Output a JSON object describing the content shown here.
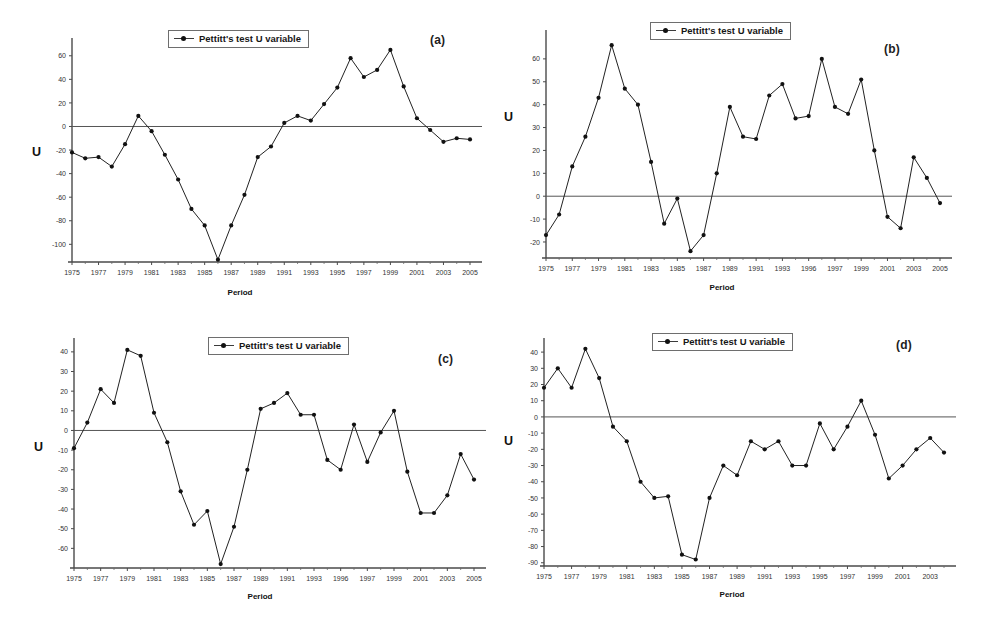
{
  "figure": {
    "legend_label": "Pettitt's test U variable",
    "x_axis_title": "Period",
    "y_axis_title": "U",
    "zero_line_color": "#555555",
    "series_color": "#222222",
    "marker_color": "#111111"
  },
  "chart_data": [
    {
      "type": "line",
      "panel": "(a)",
      "title": "",
      "xlabel": "Period",
      "ylabel": "U",
      "legend": [
        "Pettitt's test U variable"
      ],
      "legend_position": "top-center",
      "grid": false,
      "xlim": [
        1975,
        2005
      ],
      "ylim": [
        -115,
        70
      ],
      "yticks": [
        60,
        40,
        20,
        0,
        -20,
        -40,
        -60,
        -80,
        -100
      ],
      "ytick_labels": [
        "60",
        "40",
        "20",
        "0",
        "-20",
        "-40",
        "-60",
        "-80",
        "-100"
      ],
      "xticks": [
        1975,
        1977,
        1979,
        1981,
        1983,
        1985,
        1987,
        1989,
        1991,
        1993,
        1995,
        1997,
        1999,
        2001,
        2003,
        2005
      ],
      "xtick_labels": [
        "1975",
        "1977",
        "1979",
        "1981",
        "1983",
        "1985",
        "1987",
        "1989",
        "1991",
        "1993",
        "1995",
        "1997",
        "1999",
        "2001",
        "2003",
        "2005"
      ],
      "x": [
        1975,
        1976,
        1977,
        1978,
        1979,
        1980,
        1981,
        1982,
        1983,
        1984,
        1985,
        1986,
        1987,
        1988,
        1989,
        1990,
        1991,
        1992,
        1993,
        1994,
        1995,
        1996,
        1997,
        1998,
        1999,
        2000,
        2001,
        2002,
        2003,
        2004,
        2005
      ],
      "values": [
        -22,
        -27,
        -26,
        -34,
        -15,
        9,
        -4,
        -24,
        -45,
        -70,
        -84,
        -113,
        -84,
        -58,
        -26,
        -17,
        3,
        9,
        5,
        19,
        33,
        58,
        42,
        48,
        65,
        34,
        7,
        -3,
        -13,
        -10,
        -11
      ]
    },
    {
      "type": "line",
      "panel": "(b)",
      "title": "",
      "xlabel": "Period",
      "ylabel": "U",
      "legend": [
        "Pettitt's test U variable"
      ],
      "legend_position": "top-center",
      "grid": false,
      "xlim": [
        1975,
        2005
      ],
      "ylim": [
        -27,
        70
      ],
      "yticks": [
        60,
        50,
        40,
        30,
        20,
        10,
        0,
        -10,
        -20
      ],
      "ytick_labels": [
        "60",
        "50",
        "40",
        "30",
        "20",
        "10",
        "0",
        "-10",
        "-20"
      ],
      "xticks": [
        1975,
        1977,
        1979,
        1981,
        1983,
        1985,
        1987,
        1989,
        1991,
        1993,
        1995,
        1997,
        1999,
        2001,
        2003,
        2005
      ],
      "xtick_labels": [
        "1975",
        "1977",
        "1979",
        "1981",
        "1983",
        "1985",
        "1987",
        "1989",
        "1991",
        "1993",
        "1996",
        "1997",
        "1999",
        "2001",
        "2003",
        "2005"
      ],
      "x": [
        1975,
        1976,
        1977,
        1978,
        1979,
        1980,
        1981,
        1982,
        1983,
        1984,
        1985,
        1986,
        1987,
        1988,
        1989,
        1990,
        1991,
        1992,
        1993,
        1994,
        1995,
        1996,
        1997,
        1998,
        1999,
        2000,
        2001,
        2002,
        2003,
        2004,
        2005
      ],
      "values": [
        -17,
        -8,
        13,
        26,
        43,
        66,
        47,
        40,
        15,
        -12,
        -1,
        -24,
        -17,
        10,
        39,
        26,
        25,
        44,
        49,
        34,
        35,
        60,
        39,
        36,
        51,
        20,
        -9,
        -14,
        17,
        8,
        -3
      ]
    },
    {
      "type": "line",
      "panel": "(c)",
      "title": "",
      "xlabel": "Period",
      "ylabel": "U",
      "legend": [
        "Pettitt's test U variable"
      ],
      "legend_position": "top-center",
      "grid": false,
      "xlim": [
        1975,
        2005
      ],
      "ylim": [
        -70,
        44
      ],
      "yticks": [
        40,
        30,
        20,
        10,
        0,
        -10,
        -20,
        -30,
        -40,
        -50,
        -60
      ],
      "ytick_labels": [
        "40",
        "30",
        "20",
        "10",
        "0",
        "-10",
        "-20",
        "-30",
        "-40",
        "-50",
        "-60"
      ],
      "xticks": [
        1975,
        1977,
        1979,
        1981,
        1983,
        1985,
        1987,
        1989,
        1991,
        1993,
        1995,
        1997,
        1999,
        2001,
        2003,
        2005
      ],
      "xtick_labels": [
        "1975",
        "1977",
        "1979",
        "1981",
        "1983",
        "1985",
        "1987",
        "1989",
        "1991",
        "1993",
        "1996",
        "1997",
        "1999",
        "2001",
        "2003",
        "2005"
      ],
      "x": [
        1975,
        1976,
        1977,
        1978,
        1979,
        1980,
        1981,
        1982,
        1983,
        1984,
        1985,
        1986,
        1987,
        1988,
        1989,
        1990,
        1991,
        1992,
        1993,
        1994,
        1995,
        1996,
        1997,
        1998,
        1999,
        2000,
        2001,
        2002,
        2003,
        2004,
        2005
      ],
      "values": [
        -9,
        4,
        21,
        14,
        41,
        38,
        9,
        -6,
        -31,
        -48,
        -41,
        -68,
        -49,
        -20,
        11,
        14,
        19,
        8,
        8,
        -15,
        -20,
        3,
        -16,
        -1,
        10,
        -21,
        -42,
        -42,
        -33,
        -12,
        -25
      ]
    },
    {
      "type": "line",
      "panel": "(d)",
      "title": "",
      "xlabel": "Period",
      "ylabel": "U",
      "legend": [
        "Pettitt's test U variable"
      ],
      "legend_position": "top-center",
      "grid": false,
      "xlim": [
        1975,
        2004
      ],
      "ylim": [
        -92,
        45
      ],
      "yticks": [
        40,
        30,
        20,
        10,
        0,
        -10,
        -20,
        -30,
        -40,
        -50,
        -60,
        -70,
        -80,
        -90
      ],
      "ytick_labels": [
        "40",
        "30",
        "20",
        "10",
        "0",
        "-10",
        "-20",
        "-30",
        "-40",
        "-50",
        "-60",
        "-70",
        "-80",
        "-90"
      ],
      "xticks": [
        1975,
        1977,
        1979,
        1981,
        1983,
        1985,
        1987,
        1989,
        1991,
        1993,
        1995,
        1997,
        1999,
        2001,
        2003
      ],
      "xtick_labels": [
        "1975",
        "1977",
        "1979",
        "1981",
        "1983",
        "1985",
        "1987",
        "1989",
        "1991",
        "1993",
        "1995",
        "1997",
        "1999",
        "2001",
        "2003"
      ],
      "x": [
        1975,
        1976,
        1977,
        1978,
        1979,
        1980,
        1981,
        1982,
        1983,
        1984,
        1985,
        1986,
        1987,
        1988,
        1989,
        1990,
        1991,
        1992,
        1993,
        1994,
        1995,
        1996,
        1997,
        1998,
        1999,
        2000,
        2001,
        2002,
        2003,
        2004
      ],
      "values": [
        18,
        30,
        18,
        42,
        24,
        -6,
        -15,
        -40,
        -50,
        -49,
        -85,
        -88,
        -50,
        -30,
        -36,
        -15,
        -20,
        -15,
        -30,
        -30,
        -4,
        -20,
        -6,
        10,
        -11,
        -38,
        -30,
        -20,
        -13,
        -22
      ]
    }
  ]
}
